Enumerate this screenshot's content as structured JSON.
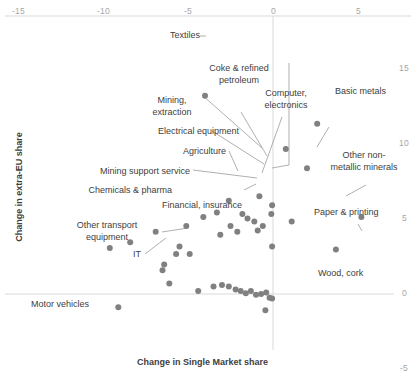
{
  "chart_data": {
    "type": "scatter",
    "title": "",
    "xlabel": "Change in Single Market share",
    "ylabel": "Change in extra-EU share",
    "xlim": [
      -16.1,
      6.5
    ],
    "ylim": [
      -5.5,
      16.5
    ],
    "xticks": [
      -15,
      -10,
      -5,
      0,
      5
    ],
    "xtick_labels": [
      "-15",
      "-10",
      "-5",
      "0",
      "5"
    ],
    "yticks": [
      -5,
      0,
      5,
      10,
      15
    ],
    "ytick_labels": [
      "-5",
      "0",
      "5",
      "10",
      "15"
    ],
    "grid": false,
    "xaxis_position": "top",
    "yaxis_position": "right",
    "legend": "none",
    "marker_color": "#808080",
    "axis_color": "#d9d9d9",
    "labelled_points": [
      {
        "label": "Textiles",
        "x": -4.0,
        "y": 13.4
      },
      {
        "label": "Coke & refined\npetroleum",
        "x": -0.05,
        "y": 6.0
      },
      {
        "label": "Mining,\nextraction",
        "x": -0.8,
        "y": 6.6
      },
      {
        "label": "Electrical equipment",
        "x": -0.1,
        "y": 5.4
      },
      {
        "label": "Agriculture",
        "x": -1.1,
        "y": 4.9
      },
      {
        "label": "Mining support service",
        "x": -2.1,
        "y": 4.2
      },
      {
        "label": "Chemicals & pharma",
        "x": -0.6,
        "y": 4.6
      },
      {
        "label": "Financial, insurance",
        "x": -1.5,
        "y": 5.1
      },
      {
        "label": "Other transport\nequipment",
        "x": -4.1,
        "y": 5.2
      },
      {
        "label": "IT",
        "x": -5.1,
        "y": 4.6
      },
      {
        "label": "Motor vehicles",
        "x": -9.1,
        "y": -0.9
      },
      {
        "label": "Computer,\nelectronics",
        "x": 0.75,
        "y": 9.8
      },
      {
        "label": "Basic metals",
        "x": 2.6,
        "y": 11.5
      },
      {
        "label": "Other non-\nmetallic minerals",
        "x": 2.0,
        "y": 8.5
      },
      {
        "label": "Paper & printing",
        "x": 5.2,
        "y": 5.2
      },
      {
        "label": "Wood, cork",
        "x": 3.7,
        "y": 3.0
      }
    ],
    "unlabelled_points": [
      {
        "x": -2.6,
        "y": 6.3
      },
      {
        "x": -3.3,
        "y": 5.5
      },
      {
        "x": -1.8,
        "y": 5.4
      },
      {
        "x": -2.5,
        "y": 4.6
      },
      {
        "x": -0.9,
        "y": 4.3
      },
      {
        "x": -3.1,
        "y": 4.0
      },
      {
        "x": -6.9,
        "y": 4.2
      },
      {
        "x": -8.4,
        "y": 3.5
      },
      {
        "x": -9.6,
        "y": 3.1
      },
      {
        "x": -5.5,
        "y": 3.2
      },
      {
        "x": -5.7,
        "y": 2.7
      },
      {
        "x": -4.9,
        "y": 2.7
      },
      {
        "x": -0.05,
        "y": 3.2
      },
      {
        "x": -6.4,
        "y": 2.0
      },
      {
        "x": -6.5,
        "y": 1.6
      },
      {
        "x": -6.1,
        "y": 0.7
      },
      {
        "x": -4.4,
        "y": 0.2
      },
      {
        "x": -3.5,
        "y": 0.5
      },
      {
        "x": -3.0,
        "y": 0.6
      },
      {
        "x": -2.6,
        "y": 0.5
      },
      {
        "x": -2.2,
        "y": 0.3
      },
      {
        "x": -1.9,
        "y": 0.2
      },
      {
        "x": -1.6,
        "y": 0.05
      },
      {
        "x": -1.3,
        "y": 0.2
      },
      {
        "x": -1.0,
        "y": -0.05
      },
      {
        "x": -0.7,
        "y": 0.0
      },
      {
        "x": -0.4,
        "y": 0.1
      },
      {
        "x": -0.2,
        "y": -0.25
      },
      {
        "x": -0.05,
        "y": -0.3
      },
      {
        "x": -0.45,
        "y": -1.1
      },
      {
        "x": 1.1,
        "y": 4.9
      }
    ]
  },
  "axes": {
    "x_title": "Change in Single Market share",
    "y_title": "Change in extra-EU share",
    "x_ticks": [
      "-15",
      "-10",
      "-5",
      "0",
      "5"
    ],
    "y_ticks": [
      "15",
      "10",
      "5",
      "0",
      "-5"
    ]
  },
  "labels": {
    "textiles": "Textiles",
    "coke_petroleum_line1": "Coke & refined",
    "coke_petroleum_line2": "petroleum",
    "mining_line1": "Mining,",
    "mining_line2": "extraction",
    "electrical_equipment": "Electrical equipment",
    "agriculture": "Agriculture",
    "mining_support": "Mining support service",
    "chemicals_pharma": "Chemicals & pharma",
    "financial_insurance": "Financial, insurance",
    "other_transport_line1": "Other transport",
    "other_transport_line2": "equipment",
    "it": "IT",
    "motor_vehicles": "Motor vehicles",
    "computer_line1": "Computer,",
    "computer_line2": "electronics",
    "basic_metals": "Basic metals",
    "other_nonmetallic_line1": "Other non-",
    "other_nonmetallic_line2": "metallic minerals",
    "paper_printing": "Paper & printing",
    "wood_cork": "Wood, cork"
  }
}
